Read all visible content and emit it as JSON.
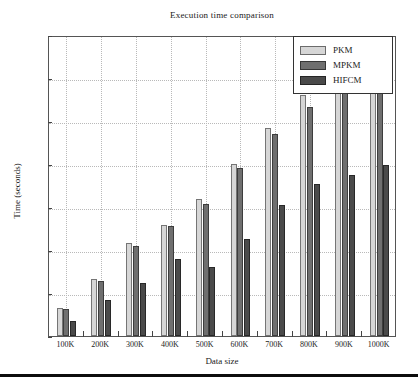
{
  "chart_data": {
    "type": "bar",
    "title": "Execution time comparison",
    "xlabel": "Data size",
    "ylabel": "Time (seconds)",
    "categories": [
      "100K",
      "200K",
      "300K",
      "400K",
      "500K",
      "600K",
      "700K",
      "800K",
      "900K",
      "1000K"
    ],
    "series": [
      {
        "name": "PKM",
        "color": "#d6d6d6",
        "values": [
          3.2,
          6.6,
          10.8,
          12.9,
          15.9,
          20.0,
          24.2,
          28.0,
          32.0,
          33.5
        ]
      },
      {
        "name": "MPKM",
        "color": "#6f6f6f",
        "values": [
          3.1,
          6.4,
          10.5,
          12.8,
          15.3,
          19.5,
          23.5,
          26.6,
          31.0,
          32.5
        ]
      },
      {
        "name": "HIFCM",
        "color": "#4a4a4a",
        "values": [
          1.7,
          4.2,
          6.2,
          8.9,
          8.0,
          11.3,
          15.2,
          17.7,
          18.7,
          19.9
        ]
      }
    ],
    "ylim": [
      0,
      35
    ],
    "yticks": [
      0,
      5,
      10,
      15,
      20,
      25,
      30,
      35
    ],
    "grid": true,
    "legend_position": "upper right"
  },
  "legend": {
    "items": [
      {
        "label": "PKM"
      },
      {
        "label": "MPKM"
      },
      {
        "label": "HIFCM"
      }
    ]
  }
}
